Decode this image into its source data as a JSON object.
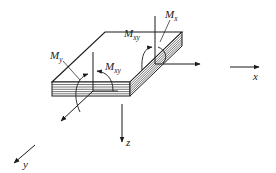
{
  "figure": {
    "line_color": "#1a1a1a",
    "background": "#ffffff"
  },
  "axes": {
    "x": {
      "label": "x"
    },
    "y": {
      "label": "y"
    },
    "z": {
      "label": "z"
    }
  },
  "moments": {
    "mx": {
      "symbol": "M",
      "subscript": "x"
    },
    "my": {
      "symbol": "M",
      "subscript": "y"
    },
    "mxy_front": {
      "symbol": "M",
      "subscript": "xy"
    },
    "mxy_right": {
      "symbol": "M",
      "subscript": "xy"
    }
  }
}
